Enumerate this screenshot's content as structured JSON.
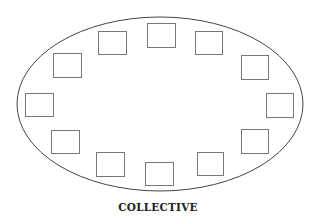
{
  "diagram": {
    "caption": "COLLECTIVE",
    "ellipse": {
      "cx": 160,
      "cy": 104,
      "rx": 143,
      "ry": 87,
      "stroke": "#444444"
    },
    "member_box_stroke": "#777777",
    "member_boxes": [
      {
        "x": 147,
        "y": 23,
        "w": 28,
        "h": 24
      },
      {
        "x": 98,
        "y": 31,
        "w": 28,
        "h": 23
      },
      {
        "x": 195,
        "y": 31,
        "w": 27,
        "h": 23
      },
      {
        "x": 53,
        "y": 53,
        "w": 28,
        "h": 24
      },
      {
        "x": 241,
        "y": 55,
        "w": 27,
        "h": 24
      },
      {
        "x": 25,
        "y": 93,
        "w": 28,
        "h": 23
      },
      {
        "x": 266,
        "y": 93,
        "w": 27,
        "h": 24
      },
      {
        "x": 51,
        "y": 130,
        "w": 28,
        "h": 23
      },
      {
        "x": 241,
        "y": 129,
        "w": 27,
        "h": 24
      },
      {
        "x": 96,
        "y": 152,
        "w": 28,
        "h": 24
      },
      {
        "x": 197,
        "y": 152,
        "w": 26,
        "h": 23
      },
      {
        "x": 145,
        "y": 162,
        "w": 28,
        "h": 23
      }
    ]
  }
}
